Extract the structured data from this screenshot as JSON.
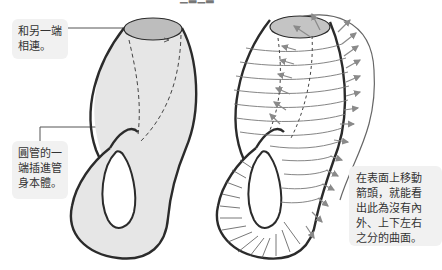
{
  "top_caption": {
    "text": "(cut off)",
    "visible": "partial"
  },
  "callouts": {
    "top_left": {
      "lines": [
        "和另一端",
        "相連。"
      ]
    },
    "mid_left": {
      "lines": [
        "圓管的一",
        "端插進管",
        "身本體。"
      ]
    },
    "right": {
      "lines": [
        "在表面上移動",
        "箭頭，就能看",
        "出此為沒有內",
        "外、上下左右",
        "之分的曲面。"
      ]
    }
  },
  "figures": {
    "left": {
      "name": "klein-bottle-plain",
      "fill": "#e6e6e6",
      "opening_fill": "#bdbdbd",
      "outline": "#2b2b2b"
    },
    "right": {
      "name": "klein-bottle-with-orientation-arrows",
      "fill": "#ffffff",
      "opening_fill": "#c4c4c4",
      "outline": "#2b2b2b",
      "arrow_color": "#8a8a8a"
    }
  },
  "colors": {
    "callout_bg": "#f1f1f1",
    "text": "#333333",
    "leader_line": "#555555"
  }
}
